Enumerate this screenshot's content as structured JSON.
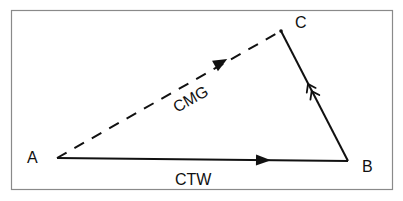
{
  "diagram": {
    "type": "vector-triangle",
    "frame": {
      "x": 11,
      "y": 10,
      "width": 381,
      "height": 179,
      "stroke": "#8a8a8a"
    },
    "colors": {
      "line": "#111111",
      "background": "#ffffff"
    },
    "points": {
      "A": {
        "label": "A",
        "x": 57,
        "y": 158,
        "label_x": 27,
        "label_y": 163
      },
      "B": {
        "label": "B",
        "x": 348,
        "y": 161,
        "label_x": 362,
        "label_y": 172
      },
      "C": {
        "label": "C",
        "x": 281,
        "y": 31,
        "label_x": 295,
        "label_y": 28
      }
    },
    "vectors": [
      {
        "id": "ctw",
        "label": "CTW",
        "from": "A",
        "to": "B",
        "style": "solid",
        "arrow": "filled-triangle"
      },
      {
        "id": "current",
        "label": "",
        "from": "B",
        "to": "C",
        "style": "solid",
        "arrow": "double-open-chevron"
      },
      {
        "id": "cmg",
        "label": "CMG",
        "from": "A",
        "to": "C",
        "style": "dashed",
        "arrow": "filled-triangle"
      }
    ],
    "labels": {
      "A": "A",
      "B": "B",
      "C": "C",
      "ctw": "CTW",
      "cmg": "CMG"
    }
  }
}
